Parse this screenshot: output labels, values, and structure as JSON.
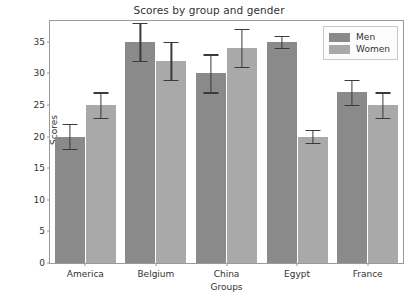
{
  "chart_data": {
    "type": "bar",
    "title": "Scores by group and gender",
    "xlabel": "Groups",
    "ylabel": "Scores",
    "categories": [
      "America",
      "Belgium",
      "China",
      "Egypt",
      "France"
    ],
    "series": [
      {
        "name": "Men",
        "color": "#8a8a8a",
        "values": [
          20,
          35,
          30,
          35,
          27
        ],
        "errors": [
          2,
          3,
          3,
          1,
          2
        ]
      },
      {
        "name": "Women",
        "color": "#a9a9a9",
        "values": [
          25,
          32,
          34,
          20,
          25
        ],
        "errors": [
          2,
          3,
          3,
          1,
          2
        ]
      }
    ],
    "ylim": [
      0,
      38.3
    ],
    "yticks": [
      0,
      5,
      10,
      15,
      20,
      25,
      30,
      35
    ],
    "grid": false,
    "legend_position": "upper right",
    "errorbar_color": "#3a3a3a"
  },
  "legend": {
    "entries": [
      "Men",
      "Women"
    ]
  }
}
